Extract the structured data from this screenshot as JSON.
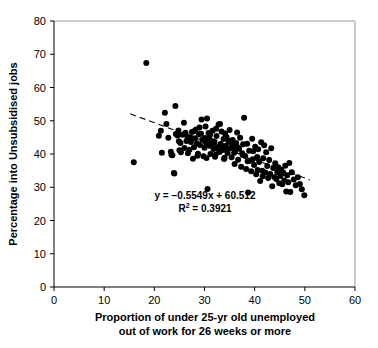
{
  "chart_data": {
    "type": "scatter",
    "title": "",
    "xlabel": "Proportion of under 25-yr old unemployed out of work for 26 weeks or more",
    "xlabel_line1": "Proportion of under 25-yr old unemployed",
    "xlabel_line2": "out of work for 26 weeks or more",
    "ylabel": "Percentage into Unsubsidised jobs",
    "xlim": [
      0,
      60
    ],
    "ylim": [
      0,
      80
    ],
    "xticks": [
      0,
      10,
      20,
      30,
      40,
      50,
      60
    ],
    "yticks": [
      0,
      10,
      20,
      30,
      40,
      50,
      60,
      70,
      80
    ],
    "xtick_labels": [
      "0",
      "10",
      "20",
      "30",
      "40",
      "50",
      "60"
    ],
    "ytick_labels": [
      "0",
      "10",
      "20",
      "30",
      "40",
      "50",
      "60",
      "70",
      "80"
    ],
    "grid": false,
    "legend": false,
    "marker": "filled-circle",
    "marker_color": "#000000",
    "marker_size": 3.0,
    "annotations": [
      {
        "name": "regression-equation",
        "text": "y = −0.5549x + 60.512"
      },
      {
        "name": "r-squared",
        "text_prefix": "R",
        "text_sup": "2",
        "text_suffix": " = 0.3921"
      }
    ],
    "trendline": {
      "style": "dashed",
      "color": "#000000",
      "slope": -0.5549,
      "intercept": 60.512,
      "x_start": 15.2,
      "x_end": 51.0
    },
    "points": [
      [
        15.9,
        37.5
      ],
      [
        18.4,
        67.4
      ],
      [
        20.9,
        45.5
      ],
      [
        21.3,
        47.0
      ],
      [
        21.5,
        40.4
      ],
      [
        22.1,
        52.4
      ],
      [
        22.4,
        49.0
      ],
      [
        23.3,
        40.7
      ],
      [
        23.4,
        39.8
      ],
      [
        23.6,
        39.6
      ],
      [
        23.9,
        34.3
      ],
      [
        24.0,
        34.1
      ],
      [
        24.2,
        54.4
      ],
      [
        24.3,
        46.0
      ],
      [
        24.6,
        45.6
      ],
      [
        24.8,
        47.1
      ],
      [
        25.0,
        41.1
      ],
      [
        25.3,
        40.5
      ],
      [
        25.6,
        45.8
      ],
      [
        25.9,
        49.4
      ],
      [
        26.2,
        46.4
      ],
      [
        26.4,
        43.9
      ],
      [
        26.6,
        45.2
      ],
      [
        26.8,
        44.1
      ],
      [
        27.0,
        41.3
      ],
      [
        27.2,
        45.0
      ],
      [
        27.5,
        46.6
      ],
      [
        27.7,
        38.6
      ],
      [
        27.9,
        42.0
      ],
      [
        28.1,
        44.7
      ],
      [
        28.3,
        47.4
      ],
      [
        28.5,
        43.2
      ],
      [
        28.7,
        40.1
      ],
      [
        28.9,
        45.9
      ],
      [
        29.1,
        42.7
      ],
      [
        29.3,
        46.1
      ],
      [
        29.4,
        50.4
      ],
      [
        29.6,
        44.3
      ],
      [
        29.8,
        39.3
      ],
      [
        30.0,
        41.9
      ],
      [
        30.1,
        44.8
      ],
      [
        30.3,
        43.4
      ],
      [
        30.5,
        50.7
      ],
      [
        30.6,
        29.5
      ],
      [
        30.8,
        46.3
      ],
      [
        31.0,
        42.5
      ],
      [
        31.2,
        40.0
      ],
      [
        31.4,
        44.0
      ],
      [
        31.6,
        47.0
      ],
      [
        31.8,
        41.5
      ],
      [
        32.0,
        43.7
      ],
      [
        32.2,
        39.8
      ],
      [
        32.4,
        45.4
      ],
      [
        32.6,
        42.1
      ],
      [
        32.8,
        48.9
      ],
      [
        33.0,
        40.6
      ],
      [
        33.2,
        43.0
      ],
      [
        33.4,
        46.8
      ],
      [
        33.6,
        41.2
      ],
      [
        33.8,
        44.5
      ],
      [
        34.0,
        38.9
      ],
      [
        34.2,
        42.4
      ],
      [
        34.4,
        45.1
      ],
      [
        34.6,
        40.3
      ],
      [
        34.8,
        43.6
      ],
      [
        35.0,
        47.2
      ],
      [
        35.2,
        41.8
      ],
      [
        35.4,
        39.0
      ],
      [
        35.6,
        44.2
      ],
      [
        35.8,
        42.8
      ],
      [
        36.0,
        37.0
      ],
      [
        36.1,
        40.9
      ],
      [
        36.3,
        43.3
      ],
      [
        36.5,
        46.5
      ],
      [
        36.7,
        38.3
      ],
      [
        36.9,
        41.6
      ],
      [
        37.1,
        44.9
      ],
      [
        37.3,
        36.2
      ],
      [
        37.5,
        40.2
      ],
      [
        37.7,
        42.9
      ],
      [
        37.9,
        50.9
      ],
      [
        38.1,
        39.4
      ],
      [
        38.3,
        35.5
      ],
      [
        38.5,
        43.1
      ],
      [
        38.7,
        28.4
      ],
      [
        38.9,
        41.0
      ],
      [
        39.1,
        38.0
      ],
      [
        39.3,
        34.8
      ],
      [
        39.5,
        44.6
      ],
      [
        39.7,
        40.8
      ],
      [
        39.9,
        36.7
      ],
      [
        40.1,
        42.2
      ],
      [
        40.3,
        33.9
      ],
      [
        40.5,
        39.1
      ],
      [
        40.7,
        41.4
      ],
      [
        40.9,
        37.6
      ],
      [
        41.1,
        31.9
      ],
      [
        41.3,
        43.5
      ],
      [
        41.5,
        35.0
      ],
      [
        41.7,
        38.7
      ],
      [
        41.9,
        42.6
      ],
      [
        42.1,
        34.4
      ],
      [
        42.3,
        40.5
      ],
      [
        42.5,
        36.4
      ],
      [
        42.7,
        32.8
      ],
      [
        42.9,
        38.2
      ],
      [
        43.1,
        34.0
      ],
      [
        43.3,
        41.7
      ],
      [
        43.5,
        30.3
      ],
      [
        43.7,
        35.8
      ],
      [
        43.9,
        33.1
      ],
      [
        44.1,
        37.2
      ],
      [
        44.3,
        32.5
      ],
      [
        44.5,
        34.6
      ],
      [
        44.7,
        36.0
      ],
      [
        44.9,
        31.2
      ],
      [
        45.1,
        33.4
      ],
      [
        45.3,
        35.3
      ],
      [
        45.5,
        30.9
      ],
      [
        45.7,
        34.2
      ],
      [
        45.9,
        32.0
      ],
      [
        46.1,
        36.5
      ],
      [
        46.3,
        28.7
      ],
      [
        46.5,
        33.6
      ],
      [
        46.7,
        31.5
      ],
      [
        46.9,
        37.3
      ],
      [
        47.1,
        28.6
      ],
      [
        47.4,
        34.5
      ],
      [
        47.8,
        32.3
      ],
      [
        48.2,
        30.6
      ],
      [
        48.6,
        33.0
      ],
      [
        49.0,
        31.0
      ],
      [
        49.4,
        29.4
      ],
      [
        49.9,
        27.6
      ],
      [
        25.2,
        43.3
      ],
      [
        26.0,
        41.8
      ],
      [
        27.3,
        43.6
      ],
      [
        28.0,
        46.9
      ],
      [
        29.0,
        48.0
      ],
      [
        30.2,
        48.3
      ],
      [
        31.1,
        45.8
      ],
      [
        32.3,
        47.6
      ],
      [
        33.1,
        49.0
      ],
      [
        34.1,
        46.2
      ],
      [
        35.1,
        43.9
      ],
      [
        30.9,
        44.6
      ],
      [
        31.7,
        43.2
      ],
      [
        32.9,
        41.1
      ],
      [
        33.7,
        42.3
      ],
      [
        34.5,
        41.0
      ],
      [
        35.5,
        42.1
      ],
      [
        36.6,
        42.0
      ],
      [
        37.6,
        39.7
      ],
      [
        38.6,
        37.8
      ],
      [
        39.6,
        38.4
      ],
      [
        40.6,
        35.2
      ],
      [
        41.6,
        33.3
      ],
      [
        22.8,
        44.9
      ],
      [
        24.9,
        43.8
      ],
      [
        26.7,
        40.2
      ],
      [
        28.6,
        39.5
      ],
      [
        30.4,
        38.8
      ],
      [
        32.1,
        39.2
      ],
      [
        33.9,
        38.5
      ],
      [
        35.9,
        40.4
      ]
    ]
  }
}
